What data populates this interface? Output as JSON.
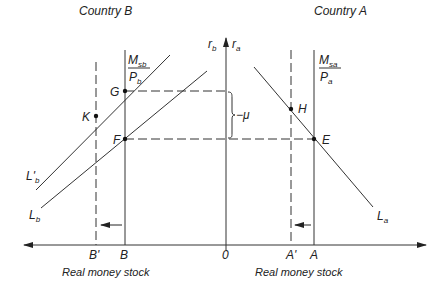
{
  "titles": {
    "left": "Country B",
    "right": "Country A"
  },
  "axis": {
    "vertical_left": "r",
    "vertical_left_sub": "b",
    "vertical_right": "r",
    "vertical_right_sub": "a",
    "origin": "0",
    "caption_left": "Real money stock",
    "caption_right": "Real money stock"
  },
  "supply": {
    "b_num": "M",
    "b_num_sub": "sb",
    "b_den": "P",
    "b_den_sub": "b",
    "a_num": "M",
    "a_num_sub": "sa",
    "a_den": "P",
    "a_den_sub": "a"
  },
  "points": {
    "G": "G",
    "F": "F",
    "K": "K",
    "H": "H",
    "E": "E"
  },
  "curves": {
    "Lb_prime": "L'",
    "Lb_prime_sub": "b",
    "Lb": "L",
    "Lb_sub": "b",
    "La": "L",
    "La_sub": "a"
  },
  "ticks": {
    "B_prime": "B'",
    "B": "B",
    "A_prime": "A'",
    "A": "A"
  },
  "gap_label": "−μ",
  "colors": {
    "line": "#333333",
    "background": "#ffffff"
  }
}
